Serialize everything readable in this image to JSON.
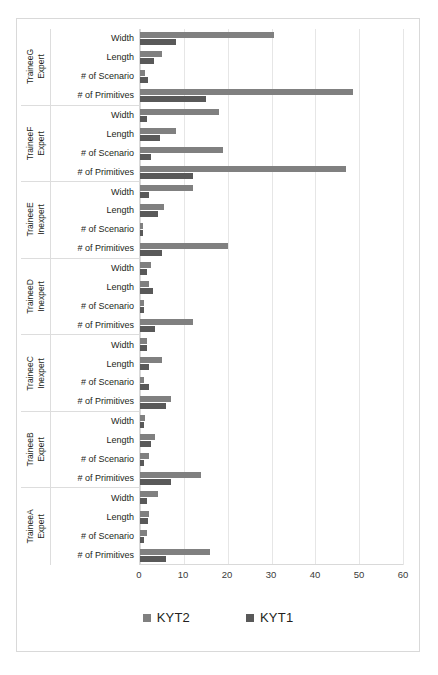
{
  "chart_data": {
    "type": "bar",
    "orientation": "horizontal",
    "title": "",
    "xlabel": "",
    "ylabel": "",
    "xlim": [
      0,
      60
    ],
    "xticks": [
      0,
      10,
      20,
      30,
      40,
      50,
      60
    ],
    "grid": true,
    "legend_position": "bottom",
    "categories": [
      "Width",
      "Length",
      "# of Scenario",
      "# of Primitives"
    ],
    "series": [
      {
        "name": "KYT2",
        "color": "#808080"
      },
      {
        "name": "KYT1",
        "color": "#595959"
      }
    ],
    "groups": [
      {
        "name": "TraineeG",
        "level": "Expert",
        "rows": [
          {
            "category": "Width",
            "KYT2": 30.5,
            "KYT1": 8.2
          },
          {
            "category": "Length",
            "KYT2": 5.0,
            "KYT1": 3.2
          },
          {
            "category": "# of Scenario",
            "KYT2": 1.2,
            "KYT1": 1.8
          },
          {
            "category": "# of Primitives",
            "KYT2": 48.6,
            "KYT1": 15.0
          }
        ]
      },
      {
        "name": "TraineeF",
        "level": "Expert",
        "rows": [
          {
            "category": "Width",
            "KYT2": 18.0,
            "KYT1": 1.5
          },
          {
            "category": "Length",
            "KYT2": 8.2,
            "KYT1": 4.5
          },
          {
            "category": "# of Scenario",
            "KYT2": 19.0,
            "KYT1": 2.5
          },
          {
            "category": "# of Primitives",
            "KYT2": 47.0,
            "KYT1": 12.0
          }
        ]
      },
      {
        "name": "TraineeE",
        "level": "Inexpert",
        "rows": [
          {
            "category": "Width",
            "KYT2": 12.0,
            "KYT1": 2.0
          },
          {
            "category": "Length",
            "KYT2": 5.5,
            "KYT1": 4.0
          },
          {
            "category": "# of Scenario",
            "KYT2": 0.6,
            "KYT1": 0.6
          },
          {
            "category": "# of Primitives",
            "KYT2": 20.0,
            "KYT1": 5.0
          }
        ]
      },
      {
        "name": "TraineeD",
        "level": "Inexpert",
        "rows": [
          {
            "category": "Width",
            "KYT2": 2.6,
            "KYT1": 1.6
          },
          {
            "category": "Length",
            "KYT2": 2.0,
            "KYT1": 3.0
          },
          {
            "category": "# of Scenario",
            "KYT2": 1.0,
            "KYT1": 0.8
          },
          {
            "category": "# of Primitives",
            "KYT2": 12.0,
            "KYT1": 3.5
          }
        ]
      },
      {
        "name": "TraineeC",
        "level": "Inexpert",
        "rows": [
          {
            "category": "Width",
            "KYT2": 1.5,
            "KYT1": 1.5
          },
          {
            "category": "Length",
            "KYT2": 5.0,
            "KYT1": 2.0
          },
          {
            "category": "# of Scenario",
            "KYT2": 1.0,
            "KYT1": 2.0
          },
          {
            "category": "# of Primitives",
            "KYT2": 7.0,
            "KYT1": 6.0
          }
        ]
      },
      {
        "name": "TraineeB",
        "level": "Expert",
        "rows": [
          {
            "category": "Width",
            "KYT2": 1.2,
            "KYT1": 1.0
          },
          {
            "category": "Length",
            "KYT2": 3.5,
            "KYT1": 2.5
          },
          {
            "category": "# of Scenario",
            "KYT2": 2.0,
            "KYT1": 1.0
          },
          {
            "category": "# of Primitives",
            "KYT2": 14.0,
            "KYT1": 7.0
          }
        ]
      },
      {
        "name": "TraineeA",
        "level": "Expert",
        "rows": [
          {
            "category": "Width",
            "KYT2": 4.0,
            "KYT1": 1.5
          },
          {
            "category": "Length",
            "KYT2": 2.0,
            "KYT1": 1.8
          },
          {
            "category": "# of Scenario",
            "KYT2": 1.5,
            "KYT1": 1.0
          },
          {
            "category": "# of Primitives",
            "KYT2": 16.0,
            "KYT1": 6.0
          }
        ]
      }
    ]
  }
}
